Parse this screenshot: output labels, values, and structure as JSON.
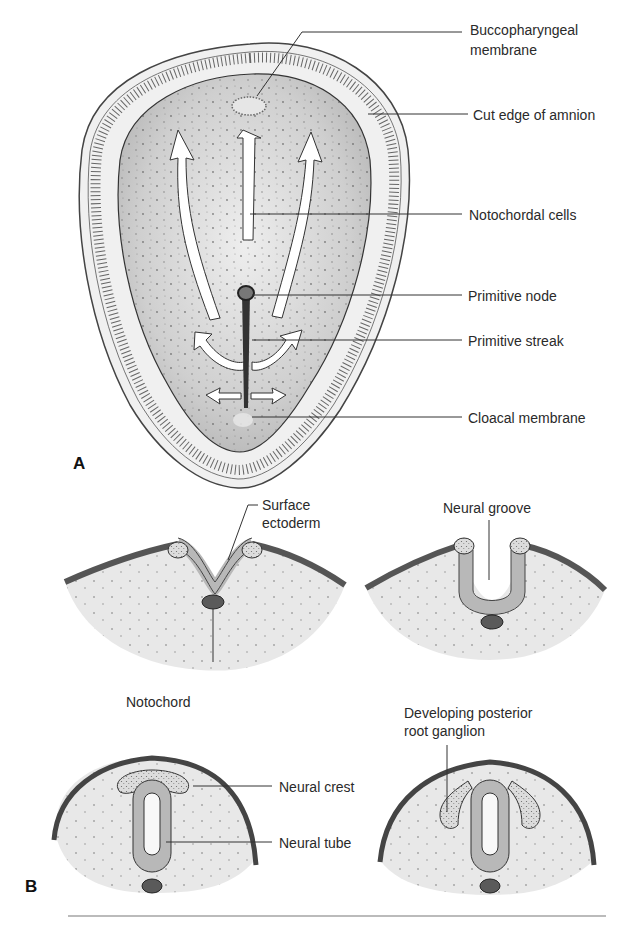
{
  "panel_a": {
    "letter": "A",
    "labels": {
      "buccopharyngeal_1": "Buccopharyngeal",
      "buccopharyngeal_2": "membrane",
      "cut_edge": "Cut edge of amnion",
      "notochordal_cells": "Notochordal cells",
      "primitive_node": "Primitive node",
      "primitive_streak": "Primitive streak",
      "cloacal_membrane": "Cloacal membrane"
    }
  },
  "panel_b": {
    "letter": "B",
    "labels": {
      "surface_ectoderm_1": "Surface",
      "surface_ectoderm_2": "ectoderm",
      "neural_groove": "Neural groove",
      "notochord": "Notochord",
      "drg_1": "Developing posterior",
      "drg_2": "root ganglion",
      "neural_crest": "Neural crest",
      "neural_tube": "Neural tube"
    }
  },
  "colors": {
    "disc_fill": "#c8c8c8",
    "amnion_ring": "#ececec",
    "mesoderm": "#e6e6e6",
    "neural_plate": "#b4b4b4",
    "ectoderm": "#555555",
    "notochord": "#5a5a5a"
  }
}
